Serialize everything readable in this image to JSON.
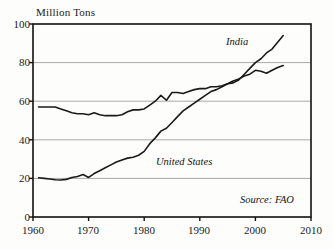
{
  "chart_data": {
    "type": "line",
    "title": "",
    "ylabel": "Million Tons",
    "xlabel": "",
    "xlim": [
      1960,
      2010
    ],
    "ylim": [
      0,
      100
    ],
    "xticks": [
      1960,
      1970,
      1980,
      1990,
      2000,
      2010
    ],
    "yticks": [
      0,
      20,
      40,
      60,
      80,
      100
    ],
    "grid": "horizontal",
    "legend": "inline-annotations",
    "annotations": [
      {
        "text": "India",
        "x": 1996,
        "y": 88
      },
      {
        "text": "United States",
        "x": 1988,
        "y": 29
      },
      {
        "text": "Source: FAO",
        "x": 2004,
        "y": 9
      }
    ],
    "series": [
      {
        "name": "India",
        "x": [
          1961,
          1962,
          1963,
          1964,
          1965,
          1966,
          1967,
          1968,
          1969,
          1970,
          1971,
          1972,
          1973,
          1974,
          1975,
          1976,
          1977,
          1978,
          1979,
          1980,
          1981,
          1982,
          1983,
          1984,
          1985,
          1986,
          1987,
          1988,
          1989,
          1990,
          1991,
          1992,
          1993,
          1994,
          1995,
          1996,
          1997,
          1998,
          1999,
          2000,
          2001,
          2002,
          2003,
          2004,
          2005
        ],
        "y": [
          57,
          57,
          57,
          57,
          56,
          55,
          54,
          53.5,
          53.5,
          53,
          54,
          53,
          52.5,
          52.5,
          52.5,
          53,
          54.5,
          55.5,
          55.5,
          56,
          58,
          60,
          63,
          60.5,
          64.5,
          64.5,
          64,
          65,
          66,
          66.5,
          66.5,
          67.5,
          67.5,
          68,
          69,
          69.5,
          71,
          74,
          77,
          80,
          82,
          85,
          87,
          90.5,
          94
        ]
      },
      {
        "name": "United States",
        "x": [
          1961,
          1962,
          1963,
          1964,
          1965,
          1966,
          1967,
          1968,
          1969,
          1970,
          1971,
          1972,
          1973,
          1974,
          1975,
          1976,
          1977,
          1978,
          1979,
          1980,
          1981,
          1982,
          1983,
          1984,
          1985,
          1986,
          1987,
          1988,
          1989,
          1990,
          1991,
          1992,
          1993,
          1994,
          1995,
          1996,
          1997,
          1998,
          1999,
          2000,
          2001,
          2002,
          2003,
          2004,
          2005
        ],
        "y": [
          20.3,
          20,
          19.7,
          19.3,
          19.2,
          19.5,
          20.5,
          21,
          22,
          20.5,
          22.5,
          24,
          25.5,
          27,
          28.5,
          29.5,
          30.5,
          31,
          32,
          34,
          38,
          41,
          44.5,
          46,
          49,
          52,
          55,
          57,
          59,
          61,
          63,
          65,
          66,
          67.5,
          69,
          70.5,
          71.5,
          73,
          74,
          76,
          75.5,
          74.5,
          76,
          77.5,
          78.5
        ]
      }
    ]
  },
  "labels": {
    "y_axis_title": "Million Tons",
    "series_india": "India",
    "series_united_states": "United States",
    "source": "Source: FAO",
    "ytick_0": "0",
    "ytick_20": "20",
    "ytick_40": "40",
    "ytick_60": "60",
    "ytick_80": "80",
    "ytick_100": "100",
    "xtick_1960": "1960",
    "xtick_1970": "1970",
    "xtick_1980": "1980",
    "xtick_1990": "1990",
    "xtick_2000": "2000",
    "xtick_2010": "2010"
  },
  "colors": {
    "background": "#fdfdfc",
    "line": "#1a1a1a",
    "grid": "#a8a8a8",
    "axis": "#111111",
    "text": "#1a1a1a"
  }
}
